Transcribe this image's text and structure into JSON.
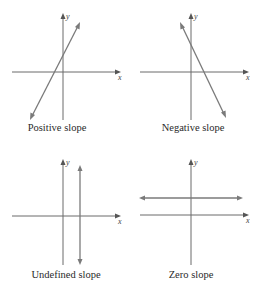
{
  "panels": [
    {
      "caption": "Positive slope",
      "x_label": "x",
      "y_label": "y",
      "line_type": "positive"
    },
    {
      "caption": "Negative slope",
      "x_label": "x",
      "y_label": "y",
      "line_type": "negative"
    },
    {
      "caption": "Undefined slope",
      "x_label": "x",
      "y_label": "y",
      "line_type": "vertical"
    },
    {
      "caption": "Zero slope",
      "x_label": "x",
      "y_label": "y",
      "line_type": "horizontal"
    }
  ],
  "colors": {
    "axis": "#6a6a6a",
    "line": "#7a7a7a",
    "text": "#2a2a2a"
  }
}
